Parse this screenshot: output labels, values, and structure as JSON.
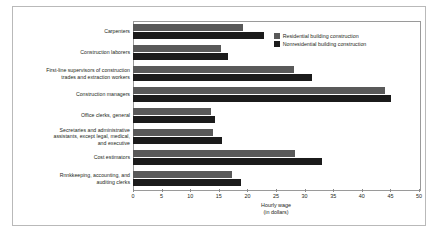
{
  "chart_data": {
    "type": "bar",
    "orientation": "horizontal",
    "title": "",
    "xlabel": "Hourly wage",
    "xlabel_sub": "(in dollars)",
    "ylabel": "",
    "xlim": [
      0,
      50
    ],
    "xticks": [
      0,
      5,
      10,
      15,
      20,
      25,
      30,
      35,
      40,
      45,
      50
    ],
    "grid": false,
    "legend_position": "top-right",
    "categories": [
      "Carpenters",
      "Construction laborers",
      "First-line supervisors of construction trades and extraction workers",
      "Construction managers",
      "Office clerks, general",
      "Secretaries and administrative assistants, except legal, medical, and executive",
      "Cost estimators",
      "Bookkeeping, accounting, and auditing clerks"
    ],
    "category_lines": [
      [
        "Carpenters"
      ],
      [
        "Construction laborers"
      ],
      [
        "First-line supervisors of construction",
        "trades and extraction workers"
      ],
      [
        "Construction managers"
      ],
      [
        "Office clerks, general"
      ],
      [
        "Secretaries and administrative",
        "assistants, except legal, medical,",
        "and executive"
      ],
      [
        "Cost estimators"
      ],
      [
        "Rnnkkeeping, accounting, and",
        "auditing clerks"
      ]
    ],
    "series": [
      {
        "name": "Residential building construction",
        "color": "#595959",
        "values": [
          19.2,
          15.4,
          28.1,
          44.0,
          13.6,
          14.0,
          28.3,
          17.3
        ]
      },
      {
        "name": "Nonresidential building construction",
        "color": "#1b1b1b",
        "values": [
          22.9,
          16.6,
          31.3,
          45.1,
          14.3,
          15.6,
          33.1,
          18.9
        ]
      }
    ]
  },
  "caption": {
    "text": ""
  }
}
